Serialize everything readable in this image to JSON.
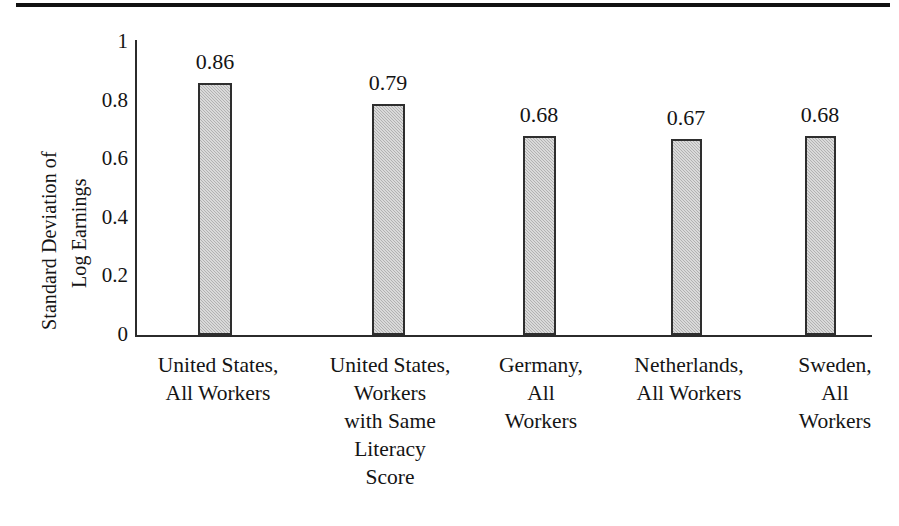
{
  "figure": {
    "has_top_rule": true,
    "background_color": "#ffffff",
    "bar_fill_color": "#bdbdbd",
    "bar_border_color": "#2e2e2e",
    "axis_color": "#2b2b2b",
    "text_color": "#141414"
  },
  "yaxis": {
    "title_line1": "Standard Deviation of",
    "title_line2": "Log Earnings",
    "ticks": [
      "1",
      "0.8",
      "0.6",
      "0.4",
      "0.2",
      "0"
    ]
  },
  "bars": [
    {
      "label_lines": [
        "United States,",
        "All Workers"
      ],
      "value_label": "0.86"
    },
    {
      "label_lines": [
        "United States,",
        "Workers",
        "with Same",
        "Literacy",
        "Score"
      ],
      "value_label": "0.79"
    },
    {
      "label_lines": [
        "Germany,",
        "All",
        "Workers"
      ],
      "value_label": "0.68"
    },
    {
      "label_lines": [
        "Netherlands,",
        "All Workers"
      ],
      "value_label": "0.67"
    },
    {
      "label_lines": [
        "Sweden,",
        "All",
        "Workers"
      ],
      "value_label": "0.68"
    }
  ],
  "chart_data": {
    "type": "bar",
    "title": "",
    "subtitle": "",
    "xlabel": "",
    "ylabel": "Standard Deviation of Log Earnings",
    "categories": [
      "United States, All Workers",
      "United States, Workers with Same Literacy Score",
      "Germany, All Workers",
      "Netherlands, All Workers",
      "Sweden, All Workers"
    ],
    "values": [
      0.86,
      0.79,
      0.68,
      0.67,
      0.68
    ],
    "data_labels": [
      "0.86",
      "0.79",
      "0.68",
      "0.67",
      "0.68"
    ],
    "ylim": [
      0,
      1
    ],
    "yticks": [
      0,
      0.2,
      0.4,
      0.6,
      0.8,
      1
    ],
    "ytick_labels": [
      "0",
      "0.2",
      "0.4",
      "0.6",
      "0.8",
      "1"
    ],
    "grid": false,
    "legend": false,
    "legend_position": "none",
    "bar_color": "#bdbdbd",
    "bar_edge_color": "#2e2e2e",
    "orientation": "vertical"
  }
}
